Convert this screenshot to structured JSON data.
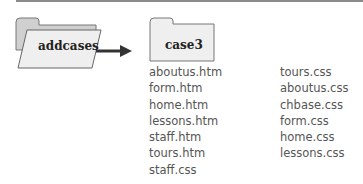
{
  "diagram": {
    "source_folder": {
      "label": "addcases"
    },
    "target_folder": {
      "label": "case3"
    },
    "arrow": {
      "from": "addcases",
      "to": "case3"
    },
    "files_col1": [
      "aboutus.htm",
      "form.htm",
      "home.htm",
      "lessons.htm",
      "staff.htm",
      "tours.htm",
      "staff.css"
    ],
    "files_col2": [
      "tours.css",
      "aboutus.css",
      "chbase.css",
      "form.css",
      "home.css",
      "lessons.css"
    ]
  },
  "colors": {
    "folder_back": "#d8d8d8",
    "folder_front": "#eeeeee",
    "outline": "#666666",
    "arrow": "#333333",
    "text": "#555555"
  }
}
